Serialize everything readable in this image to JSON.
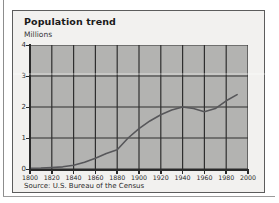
{
  "figure": {
    "title": "Population trend",
    "unit_label": "Millions",
    "source": "Source: U.S. Bureau of the Census"
  },
  "chart_data": {
    "type": "line",
    "title": "Population trend",
    "xlabel": "",
    "ylabel": "Millions",
    "xlim": [
      1800,
      2000
    ],
    "ylim": [
      0,
      4
    ],
    "grid": true,
    "legend": "none",
    "plot_background": "#b3b3b1",
    "line_color": "#57575a",
    "xticks": [
      1800,
      1820,
      1840,
      1860,
      1880,
      1900,
      1920,
      1940,
      1960,
      1980,
      2000
    ],
    "yticks": [
      0,
      1,
      2,
      3,
      4
    ],
    "x": [
      1800,
      1810,
      1820,
      1830,
      1840,
      1850,
      1860,
      1870,
      1880,
      1890,
      1900,
      1910,
      1920,
      1930,
      1940,
      1950,
      1960,
      1970,
      1980,
      1990
    ],
    "values": [
      0.02,
      0.03,
      0.05,
      0.07,
      0.12,
      0.22,
      0.35,
      0.5,
      0.62,
      1.0,
      1.3,
      1.55,
      1.75,
      1.9,
      2.0,
      1.95,
      1.85,
      1.95,
      2.2,
      2.4
    ],
    "series": [
      {
        "name": "Population",
        "values": [
          0.02,
          0.03,
          0.05,
          0.07,
          0.12,
          0.22,
          0.35,
          0.5,
          0.62,
          1.0,
          1.3,
          1.55,
          1.75,
          1.9,
          2.0,
          1.95,
          1.85,
          1.95,
          2.2,
          2.4
        ]
      }
    ]
  },
  "axes": {
    "y_tick_labels": [
      "4",
      "3",
      "2",
      "1",
      "0"
    ],
    "x_tick_labels": [
      "1800",
      "1820",
      "1840",
      "1860",
      "1880",
      "1900",
      "1920",
      "1940",
      "1960",
      "1980",
      "2000"
    ]
  }
}
